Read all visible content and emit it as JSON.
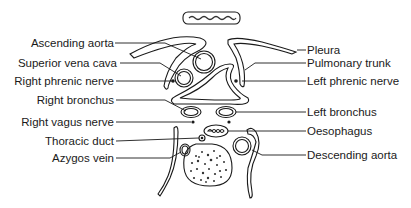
{
  "diagram": {
    "top_label_box": "~illegible~",
    "labels_left": [
      {
        "id": "ascending-aorta",
        "text": "Ascending aorta"
      },
      {
        "id": "superior-vena-cava",
        "text": "Superior vena cava"
      },
      {
        "id": "right-phrenic-nerve",
        "text": "Right phrenic nerve"
      },
      {
        "id": "right-bronchus",
        "text": "Right bronchus"
      },
      {
        "id": "right-vagus-nerve",
        "text": "Right vagus nerve"
      },
      {
        "id": "thoracic-duct",
        "text": "Thoracic duct"
      },
      {
        "id": "azygos-vein",
        "text": "Azygos vein"
      }
    ],
    "labels_right": [
      {
        "id": "pleura",
        "text": "Pleura"
      },
      {
        "id": "pulmonary-trunk",
        "text": "Pulmonary trunk"
      },
      {
        "id": "left-phrenic-nerve",
        "text": "Left phrenic nerve"
      },
      {
        "id": "left-bronchus",
        "text": "Left bronchus"
      },
      {
        "id": "oesophagus",
        "text": "Oesophagus"
      },
      {
        "id": "descending-aorta",
        "text": "Descending aorta"
      }
    ]
  }
}
